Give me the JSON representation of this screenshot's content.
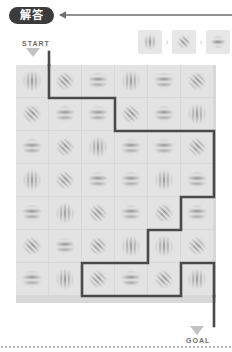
{
  "header": {
    "badge_label": "解答",
    "back_arrow_icon": "long-left-arrow-icon"
  },
  "legend": {
    "items": [
      {
        "icon": "vertical-grating-icon",
        "orientation": "vertical"
      },
      {
        "icon": "diagonal-grating-icon",
        "orientation": "diagonal"
      },
      {
        "icon": "horizontal-grating-icon",
        "orientation": "horizontal"
      }
    ],
    "separator_icon": "chevron-right-icon",
    "separator_glyph": "›"
  },
  "maze": {
    "start_label": "START",
    "goal_label": "GOAL",
    "start_arrow_icon": "down-arrow-icon",
    "goal_arrow_icon": "down-arrow-icon",
    "columns": 6,
    "rows": 7,
    "cell_size": 32,
    "gap": 1,
    "tile_bg": "#e3e3e3",
    "grid_line_color": "#d8d8d8",
    "path_color": "#4a4a4a",
    "tiles": [
      [
        "vertical",
        "diagonal",
        "horizontal",
        "vertical",
        "horizontal",
        "diagonal"
      ],
      [
        "diagonal",
        "horizontal",
        "horizontal",
        "diagonal",
        "horizontal",
        "vertical"
      ],
      [
        "horizontal",
        "diagonal",
        "vertical",
        "horizontal",
        "horizontal",
        "diagonal"
      ],
      [
        "vertical",
        "diagonal",
        "horizontal",
        "horizontal",
        "vertical",
        "horizontal"
      ],
      [
        "horizontal",
        "vertical",
        "diagonal",
        "horizontal",
        "diagonal",
        "horizontal"
      ],
      [
        "diagonal",
        "horizontal",
        "diagonal",
        "vertical",
        "vertical",
        "diagonal"
      ],
      [
        "horizontal",
        "vertical",
        "diagonal",
        "horizontal",
        "diagonal",
        "vertical"
      ]
    ],
    "solution_path": [
      [
        1,
        0
      ],
      [
        1,
        1
      ],
      [
        3,
        1
      ],
      [
        3,
        2
      ],
      [
        6,
        2
      ],
      [
        6,
        4
      ],
      [
        5,
        4
      ],
      [
        5,
        5
      ],
      [
        4,
        5
      ],
      [
        4,
        6
      ],
      [
        2,
        6
      ],
      [
        2,
        7
      ],
      [
        5,
        7
      ],
      [
        5,
        6
      ],
      [
        6,
        6
      ],
      [
        6,
        7
      ]
    ]
  },
  "colors": {
    "badge_bg": "#3b3b3b",
    "badge_text": "#ffffff",
    "label_text": "#6d6d6d",
    "arrow_fill": "#c2c2c2",
    "path_stroke": "#4a4a4a",
    "page_bg": "#ffffff"
  }
}
